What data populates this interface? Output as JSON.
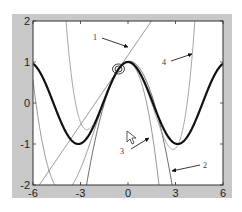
{
  "chart_data": {
    "type": "line",
    "title": "",
    "xlabel": "",
    "ylabel": "",
    "xlim": [
      -6,
      6
    ],
    "ylim": [
      -2,
      2
    ],
    "grid": false,
    "xticks": [
      -6,
      -3,
      0,
      3,
      6
    ],
    "xtick_labels": [
      "-6",
      "-3",
      "0",
      "3",
      "6"
    ],
    "yticks": [
      2,
      1,
      0,
      -1,
      -2
    ],
    "ytick_labels": [
      "2",
      "1",
      "0",
      "-1",
      "-2"
    ],
    "series": [
      {
        "name": "cos(x)",
        "style": "thick",
        "color": "#111111",
        "width": 2.2,
        "x0": 0,
        "kind": "cos"
      },
      {
        "name": "1",
        "style": "thin",
        "color": "#777777",
        "width": 0.9,
        "kind": "taylor",
        "x0": -0.6,
        "order": 1
      },
      {
        "name": "2",
        "style": "thin",
        "color": "#555555",
        "width": 0.9,
        "kind": "taylor",
        "x0": -0.6,
        "order": 2
      },
      {
        "name": "3",
        "style": "thin",
        "color": "#888888",
        "width": 0.9,
        "kind": "taylor",
        "x0": -0.6,
        "order": 3
      },
      {
        "name": "4",
        "style": "thin",
        "color": "#999999",
        "width": 0.9,
        "kind": "taylor",
        "x0": -0.6,
        "order": 4
      }
    ],
    "annotations": [
      {
        "text": "1",
        "label_x": 93,
        "label_y": 40,
        "arrow_from": [
          102,
          38
        ],
        "arrow_to": [
          128,
          47
        ]
      },
      {
        "text": "4",
        "label_x": 162,
        "label_y": 65,
        "arrow_from": [
          171,
          61
        ],
        "arrow_to": [
          192,
          54
        ]
      },
      {
        "text": "3",
        "label_x": 120,
        "label_y": 154,
        "arrow_from": [
          131,
          149
        ],
        "arrow_to": [
          149,
          138
        ]
      },
      {
        "text": "2",
        "label_x": 203,
        "label_y": 168,
        "arrow_from": [
          200,
          165
        ],
        "arrow_to": [
          172,
          171
        ]
      }
    ],
    "expansion_point_marker": {
      "x": -0.6,
      "y": 0.83,
      "shape": "double-circle"
    },
    "cursor": {
      "px": 127,
      "py": 131
    }
  },
  "colors": {
    "panel_background": "#c8c8c8",
    "axes_background": "#ffffff",
    "axes_frame": "#333333"
  }
}
